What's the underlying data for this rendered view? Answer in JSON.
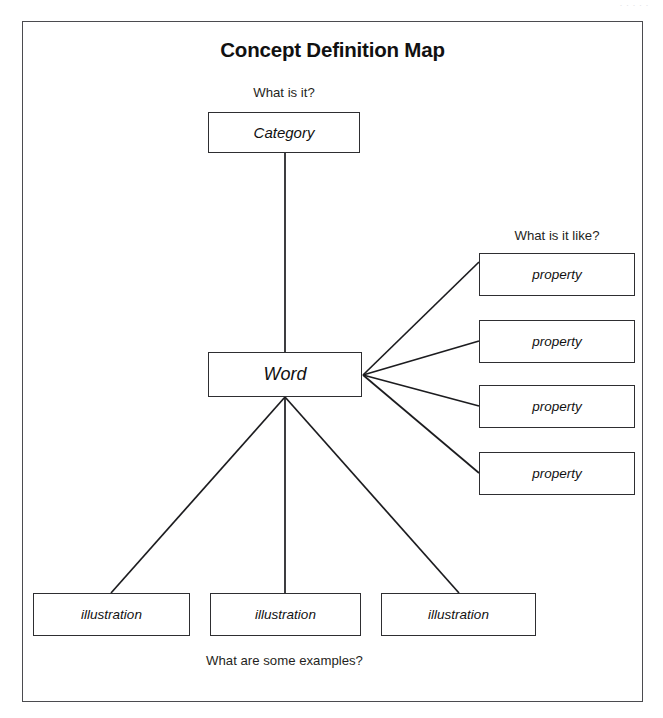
{
  "document": {
    "title": "Concept Definition Map",
    "scan_header_faint": "· ·   · ·  ·"
  },
  "captions": {
    "what_is_it": "What is it?",
    "what_is_it_like": "What is it like?",
    "what_are_some_examples": "What are some examples?"
  },
  "nodes": {
    "category": {
      "label": "Category"
    },
    "word": {
      "label": "Word"
    },
    "properties": [
      {
        "label": "property"
      },
      {
        "label": "property"
      },
      {
        "label": "property"
      },
      {
        "label": "property"
      }
    ],
    "illustrations": [
      {
        "label": "illustration"
      },
      {
        "label": "illustration"
      },
      {
        "label": "illustration"
      }
    ]
  },
  "colors": {
    "page_background": "#ffffff",
    "frame_stroke": "#4b4b4f",
    "box_stroke": "#2e2e31",
    "connector_stroke": "#1c1c1f",
    "text": "#111111"
  },
  "diagram_structure": {
    "type": "concept-definition-map",
    "root": "Word",
    "edges": [
      {
        "from": "Word",
        "to": "Category",
        "question": "What is it?"
      },
      {
        "from": "Word",
        "to": "property",
        "question": "What is it like?"
      },
      {
        "from": "Word",
        "to": "property",
        "question": "What is it like?"
      },
      {
        "from": "Word",
        "to": "property",
        "question": "What is it like?"
      },
      {
        "from": "Word",
        "to": "property",
        "question": "What is it like?"
      },
      {
        "from": "Word",
        "to": "illustration",
        "question": "What are some examples?"
      },
      {
        "from": "Word",
        "to": "illustration",
        "question": "What are some examples?"
      },
      {
        "from": "Word",
        "to": "illustration",
        "question": "What are some examples?"
      }
    ]
  }
}
